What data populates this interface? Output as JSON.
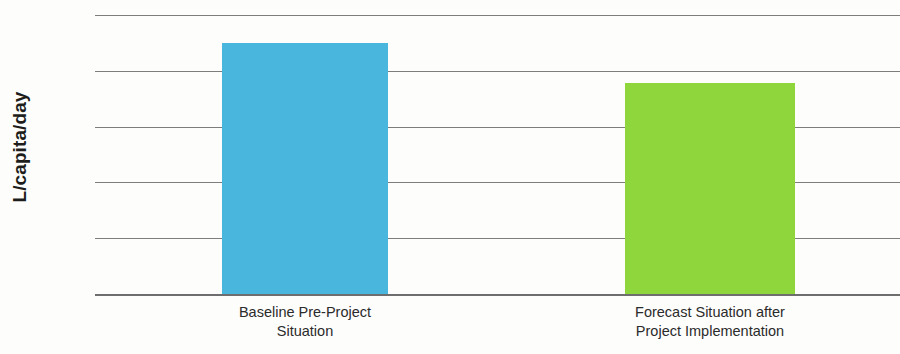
{
  "chart_data": {
    "type": "bar",
    "title": "",
    "xlabel": "",
    "ylabel": "L/capita/day",
    "ylim": [
      0,
      100
    ],
    "ytick_step": 20,
    "ytick_labels": [
      "0",
      "20",
      "40",
      "60",
      "80",
      "100"
    ],
    "ytick_values": [
      0,
      20,
      40,
      60,
      80,
      100
    ],
    "grid": true,
    "legend": "none",
    "categories": [
      "Baseline Pre-Project\nSituation",
      "Forecast Situation after\nProject Implementation"
    ],
    "values": [
      90,
      75.5
    ],
    "bar_colors": [
      "#49b6dd",
      "#8fd63c"
    ],
    "bars": [
      {
        "label": "Baseline Pre-Project\nSituation",
        "value": 90,
        "color": "#49b6dd"
      },
      {
        "label": "Forecast Situation after\nProject Implementation",
        "value": 75.5,
        "color": "#8fd63c"
      }
    ]
  },
  "colors": {
    "background": "#fdfdfc",
    "gridline": "#7d7d7d",
    "axis": "#6e6e6e",
    "text": "#1d1d1b",
    "bar_blue": "#49b6dd",
    "bar_green": "#8fd63c"
  }
}
